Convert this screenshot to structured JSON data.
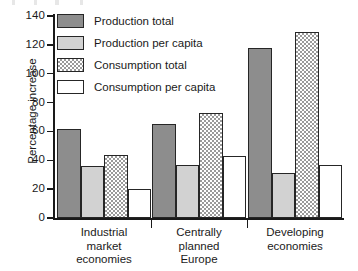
{
  "chart_data": {
    "type": "bar",
    "title": "",
    "xlabel": "",
    "ylabel": "Percentage increase",
    "ylim": [
      0,
      140
    ],
    "ytick_step": 20,
    "yticks": [
      0,
      20,
      40,
      60,
      80,
      100,
      120,
      140
    ],
    "grid": false,
    "legend_position": "upper-left-inside",
    "categories": [
      "Industrial\nmarket\neconomies",
      "Centrally\nplanned\nEurope",
      "Developing\neconomies"
    ],
    "series": [
      {
        "name": "Production total",
        "values": [
          62,
          65,
          118
        ],
        "fill": "solid-dark",
        "color": "#8d8d8d"
      },
      {
        "name": "Production per capita",
        "values": [
          36,
          37,
          31
        ],
        "fill": "light",
        "color": "#d2d2d2"
      },
      {
        "name": "Consumption total",
        "values": [
          44,
          73,
          129
        ],
        "fill": "checker",
        "color": "#9a9a9a"
      },
      {
        "name": "Consumption per capita",
        "values": [
          20,
          43,
          37
        ],
        "fill": "white",
        "color": "#ffffff"
      }
    ]
  },
  "axis": {
    "y_title": "Percentage increase",
    "tick_labels": [
      "140",
      "120",
      "100",
      "80",
      "60",
      "40",
      "20",
      "0"
    ]
  },
  "legend": {
    "entries": [
      "Production total",
      "Production per capita",
      "Consumption total",
      "Consumption per capita"
    ]
  },
  "categories": [
    "Industrial\nmarket\neconomies",
    "Centrally\nplanned\nEurope",
    "Developing\neconomies"
  ]
}
